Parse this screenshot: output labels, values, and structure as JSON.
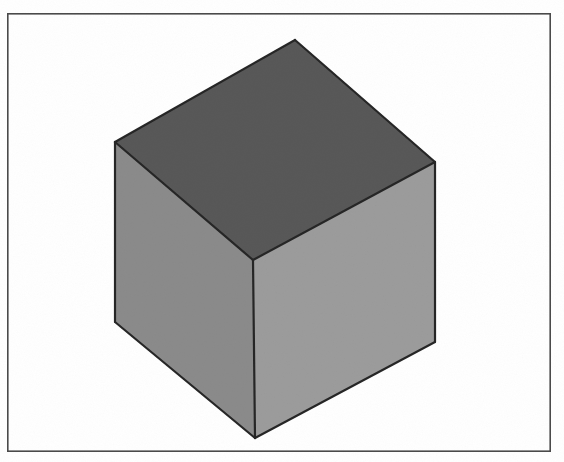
{
  "figure": {
    "background_color": "#ffffff",
    "canvas": {
      "width": 564,
      "height": 462
    },
    "frame": {
      "name": "image-border",
      "x": 7,
      "y": 13,
      "width": 544,
      "height": 439,
      "stroke_color": "#4a4a4a",
      "stroke_width": 1.6,
      "fill_color": "#ffffff"
    },
    "object": {
      "name": "cube",
      "shape": "cube",
      "edge_color": "#262626",
      "edge_width": 2.2,
      "vertices": {
        "top": {
          "x": 295,
          "y": 40
        },
        "left": {
          "x": 115,
          "y": 142
        },
        "right": {
          "x": 435,
          "y": 162
        },
        "center": {
          "x": 253,
          "y": 260
        },
        "bottom_left": {
          "x": 115,
          "y": 322
        },
        "bottom_right": {
          "x": 435,
          "y": 342
        },
        "bottom": {
          "x": 255,
          "y": 438
        }
      },
      "faces": [
        {
          "name": "cube-face-top",
          "label": "top face",
          "fill_color": "#585858",
          "shade": "dark",
          "points": "295,40 115,142 253,260 435,162"
        },
        {
          "name": "cube-face-left",
          "label": "left face",
          "fill_color": "#8b8b8b",
          "shade": "medium",
          "points": "115,142 115,322 255,438 253,260"
        },
        {
          "name": "cube-face-right",
          "label": "right face",
          "fill_color": "#9c9c9c",
          "shade": "light",
          "points": "253,260 255,438 435,342 435,162"
        }
      ],
      "edges": [
        {
          "name": "cube-edge-top-left",
          "from": "top",
          "to": "left"
        },
        {
          "name": "cube-edge-top-right",
          "from": "top",
          "to": "right"
        },
        {
          "name": "cube-edge-center-left",
          "from": "center",
          "to": "left"
        },
        {
          "name": "cube-edge-center-right",
          "from": "center",
          "to": "right"
        },
        {
          "name": "cube-edge-vertical-left",
          "from": "left",
          "to": "bottom_left"
        },
        {
          "name": "cube-edge-vertical-front",
          "from": "center",
          "to": "bottom"
        },
        {
          "name": "cube-edge-vertical-right",
          "from": "right",
          "to": "bottom_right"
        },
        {
          "name": "cube-edge-bottom-left",
          "from": "bottom_left",
          "to": "bottom"
        },
        {
          "name": "cube-edge-bottom-right",
          "from": "bottom",
          "to": "bottom_right"
        }
      ]
    },
    "captions": []
  }
}
